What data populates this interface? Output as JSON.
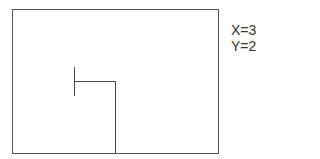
{
  "diagram": {
    "frame": {
      "x": 12,
      "y": 9,
      "width": 206,
      "height": 144,
      "stroke": "#555555"
    },
    "path": {
      "points": [
        [
          115,
          153
        ],
        [
          115,
          81
        ],
        [
          74,
          81
        ]
      ],
      "stroke": "#444444"
    },
    "tick": {
      "x": 74,
      "y1": 67,
      "y2": 96,
      "stroke": "#444444"
    }
  },
  "coordinates": {
    "x_label": "X=3",
    "y_label": "Y=2"
  }
}
